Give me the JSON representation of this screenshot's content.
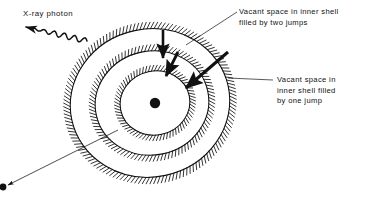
{
  "figure": {
    "background_color": "#ffffff",
    "ink_color": "#111111",
    "width": 367,
    "height": 201
  },
  "labels": {
    "xray_photon": "X-ray photon",
    "vacancy_two_jumps": {
      "line1": "Vacant space in inner shell",
      "line2": "filled by two jumps"
    },
    "vacancy_one_jump": {
      "line1": "Vacant space in",
      "line2": "inner shell filled",
      "line3": "by one jump"
    }
  },
  "chart_data": {
    "type": "diagram",
    "title": "",
    "nucleus": {
      "name": "nucleus",
      "cx": 155,
      "cy": 103,
      "r": 5.2,
      "fill": "#111111"
    },
    "shells": [
      {
        "name": "inner-shell",
        "index": 1,
        "cx": 155,
        "cy": 103,
        "rx": 35,
        "ry": 32,
        "rotation": -12,
        "hatch_ticks": 72,
        "hatch_len": 5.5
      },
      {
        "name": "middle-shell",
        "index": 2,
        "cx": 152,
        "cy": 103,
        "rx": 57,
        "ry": 52,
        "rotation": -12,
        "hatch_ticks": 104,
        "hatch_len": 6.0
      },
      {
        "name": "outer-shell",
        "index": 3,
        "cx": 150,
        "cy": 103,
        "rx": 80,
        "ry": 74,
        "rotation": -12,
        "hatch_ticks": 142,
        "hatch_len": 6.5
      }
    ],
    "jump_arrows": [
      {
        "name": "jump-outer-to-middle",
        "from": [
          163,
          30
        ],
        "to": [
          163,
          58
        ],
        "width": 2.6,
        "belongs_to": "vacancy_two_jumps"
      },
      {
        "name": "jump-middle-to-inner",
        "from": [
          178,
          52
        ],
        "to": [
          166,
          76
        ],
        "width": 2.8,
        "belongs_to": "vacancy_two_jumps"
      },
      {
        "name": "jump-outer-to-inner",
        "from": [
          228,
          52
        ],
        "to": [
          186,
          88
        ],
        "width": 3.0,
        "belongs_to": "vacancy_one_jump"
      }
    ],
    "photon_arrow": {
      "name": "xray-photon-wave",
      "from": [
        87,
        41
      ],
      "to": [
        26,
        27
      ],
      "style": "wavy",
      "amplitude": 2.6,
      "cycles": 6
    },
    "ejected_electron": {
      "name": "ejected-electron-path",
      "from": [
        118,
        130
      ],
      "to": [
        8,
        185
      ],
      "style": "thin-arrow",
      "electron_dot": {
        "cx": 3,
        "cy": 187,
        "r": 3.4
      }
    },
    "leader_lines": [
      {
        "name": "leader-two-jumps",
        "from": [
          237,
          12
        ],
        "to": [
          186,
          45
        ],
        "target_shell": "outer-shell"
      },
      {
        "name": "leader-one-jump",
        "from": [
          273,
          80
        ],
        "to": [
          228,
          78
        ],
        "target_shell": "outer-shell"
      }
    ],
    "text_positions": {
      "xray_photon": [
        23,
        16
      ],
      "vacancy_two_jumps": [
        239,
        12
      ],
      "vacancy_one_jump": [
        276,
        80
      ]
    }
  }
}
